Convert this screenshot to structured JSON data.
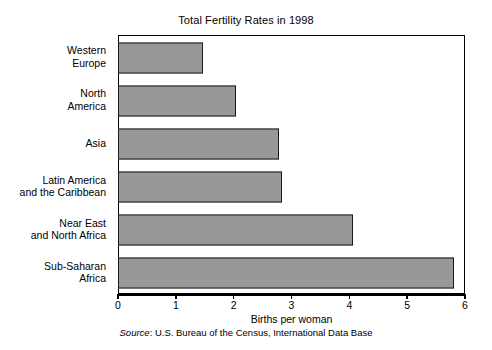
{
  "chart_data": {
    "type": "bar",
    "orientation": "horizontal",
    "title": "Total Fertility Rates in 1998",
    "xlabel": "Births per woman",
    "ylabel": "",
    "xlim": [
      0,
      6
    ],
    "xticks": [
      "0",
      "1",
      "2",
      "3",
      "4",
      "5",
      "6"
    ],
    "grid": false,
    "legend": false,
    "categories": [
      "Western\nEurope",
      "North\nAmerica",
      "Asia",
      "Latin America\nand the Caribbean",
      "Near East\nand North Africa",
      "Sub-Saharan\nAfrica"
    ],
    "values": [
      1.45,
      2.03,
      2.76,
      2.81,
      4.04,
      5.8
    ],
    "bar_fill_color": "#989898",
    "bar_border_color": "#1a1a1a",
    "axis_color": "#000000",
    "background_color": "#ffffff"
  },
  "source": {
    "label": "Source",
    "separator": ": ",
    "text": "U.S. Bureau of the Census, International Data Base"
  }
}
